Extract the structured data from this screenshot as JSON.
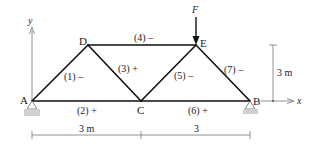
{
  "diagram": {
    "type": "truss",
    "nodes": [
      {
        "id": "A",
        "label": "A",
        "x": 32,
        "y": 101
      },
      {
        "id": "C",
        "label": "C",
        "x": 141,
        "y": 101
      },
      {
        "id": "B",
        "label": "B",
        "x": 250,
        "y": 101
      },
      {
        "id": "D",
        "label": "D",
        "x": 88,
        "y": 45
      },
      {
        "id": "E",
        "label": "E",
        "x": 196,
        "y": 45
      }
    ],
    "members": [
      {
        "id": "1",
        "label": "(1) –",
        "from": "A",
        "to": "D"
      },
      {
        "id": "2",
        "label": "(2) +",
        "from": "A",
        "to": "C"
      },
      {
        "id": "3",
        "label": "(3) +",
        "from": "D",
        "to": "C"
      },
      {
        "id": "4",
        "label": "(4) –",
        "from": "D",
        "to": "E"
      },
      {
        "id": "5",
        "label": "(5) –",
        "from": "C",
        "to": "E"
      },
      {
        "id": "6",
        "label": "(6) +",
        "from": "C",
        "to": "B"
      },
      {
        "id": "7",
        "label": "(7) –",
        "from": "E",
        "to": "B"
      }
    ],
    "load": {
      "label": "F",
      "node": "E",
      "direction": "down"
    },
    "axes": {
      "x_label": "x",
      "y_label": "y"
    },
    "dimensions": {
      "horizontal": [
        "3 m",
        "3"
      ],
      "vertical": "3 m"
    },
    "supports": [
      {
        "node": "A",
        "type": "pin"
      },
      {
        "node": "B",
        "type": "pin"
      }
    ],
    "colors": {
      "member": "#111111",
      "support_base": "#d0d0d0",
      "text": "#222222"
    }
  }
}
